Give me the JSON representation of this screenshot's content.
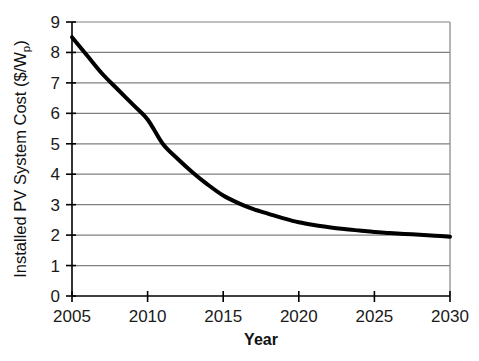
{
  "chart_data": {
    "type": "line",
    "title": "",
    "xlabel": "Year",
    "ylabel": "Installed PV System Cost ($/Wp)",
    "ylabel_main": "Installed PV System Cost ($/W",
    "ylabel_subscript": "p",
    "ylabel_tail": ")",
    "xlim": [
      2005,
      2030
    ],
    "ylim": [
      0,
      9
    ],
    "grid": "horizontal",
    "legend": "none",
    "xticks": [
      2005,
      2010,
      2015,
      2020,
      2025,
      2030
    ],
    "xtick_labels": [
      "2005",
      "2010",
      "2015",
      "2020",
      "2025",
      "2030"
    ],
    "yticks": [
      0,
      1,
      2,
      3,
      4,
      5,
      6,
      7,
      8,
      9
    ],
    "ytick_labels": [
      "0",
      "1",
      "2",
      "3",
      "4",
      "5",
      "6",
      "7",
      "8",
      "9"
    ],
    "series": [
      {
        "name": "Installed PV System Cost",
        "color": "#000000",
        "line_width": 4,
        "x": [
          2005,
          2006,
          2007,
          2008,
          2009,
          2010,
          2011,
          2012,
          2013,
          2014,
          2015,
          2016,
          2017,
          2018,
          2019,
          2020,
          2021,
          2022,
          2023,
          2024,
          2025,
          2026,
          2027,
          2028,
          2029,
          2030
        ],
        "values": [
          8.5,
          7.9,
          7.3,
          6.8,
          6.3,
          5.8,
          5.0,
          4.5,
          4.05,
          3.65,
          3.3,
          3.05,
          2.85,
          2.7,
          2.55,
          2.42,
          2.33,
          2.26,
          2.2,
          2.15,
          2.1,
          2.07,
          2.04,
          2.01,
          1.98,
          1.95
        ]
      }
    ]
  },
  "axes": {
    "x_axis_name": "year-axis",
    "y_axis_name": "cost-axis"
  }
}
